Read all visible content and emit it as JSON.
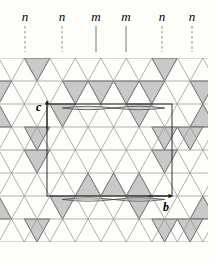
{
  "figure": {
    "width": 214,
    "height": 262,
    "background": "#fdfdfa"
  },
  "symmetry_planes": {
    "label_baseline_y": 21,
    "line_top_y": 26,
    "line_bottom_y": 52,
    "items": [
      {
        "text": "n",
        "x": 25,
        "line": "dashed"
      },
      {
        "text": "n",
        "x": 62,
        "line": "dashed"
      },
      {
        "text": "m",
        "x": 96,
        "line": "solid"
      },
      {
        "text": "m",
        "x": 126,
        "line": "solid"
      },
      {
        "text": "n",
        "x": 162,
        "line": "dashed"
      },
      {
        "text": "n",
        "x": 192,
        "line": "dashed"
      }
    ]
  },
  "axes": {
    "c": {
      "label": "c",
      "label_x": 36,
      "label_y": 111,
      "x": 47,
      "y_from": 130,
      "y_to": 100
    },
    "b": {
      "label": "b",
      "label_x": 163,
      "label_y": 211,
      "y": 196,
      "x_from": 148,
      "x_to": 173
    }
  },
  "unit_cell": {
    "x1": 47,
    "y1": 104,
    "x2": 172,
    "y2": 196
  },
  "lattice": {
    "top_y": 58,
    "row_height": 23,
    "rows": 8,
    "col_spacing": 25.5,
    "even_row_offset": -1.2,
    "odd_row_offset": 11.55,
    "clip_left": 0,
    "clip_right": 208
  },
  "shaded_triangles": [
    {
      "row": 1,
      "cx": 37.05,
      "dir": "down"
    },
    {
      "row": 1,
      "cx": 164.55,
      "dir": "down"
    },
    {
      "row": 2,
      "cx": -1.2,
      "dir": "down"
    },
    {
      "row": 2,
      "cx": 75.3,
      "dir": "down"
    },
    {
      "row": 2,
      "cx": 100.8,
      "dir": "down"
    },
    {
      "row": 2,
      "cx": 126.3,
      "dir": "down"
    },
    {
      "row": 2,
      "cx": 151.8,
      "dir": "down"
    },
    {
      "row": 2,
      "cx": 202.8,
      "dir": "down"
    },
    {
      "row": 3,
      "cx": 62.55,
      "dir": "down"
    },
    {
      "row": 3,
      "cx": 139.05,
      "dir": "down"
    },
    {
      "row": 3,
      "cx": -1.2,
      "dir": "up"
    },
    {
      "row": 3,
      "cx": 202.8,
      "dir": "up"
    },
    {
      "row": 4,
      "cx": 37.05,
      "dir": "down"
    },
    {
      "row": 4,
      "cx": 164.55,
      "dir": "down"
    },
    {
      "row": 4,
      "cx": 190.05,
      "dir": "down"
    },
    {
      "row": 5,
      "cx": 37.05,
      "dir": "down"
    },
    {
      "row": 5,
      "cx": 164.55,
      "dir": "down"
    },
    {
      "row": 6,
      "cx": 88.05,
      "dir": "up"
    },
    {
      "row": 6,
      "cx": 113.55,
      "dir": "up"
    },
    {
      "row": 6,
      "cx": 139.05,
      "dir": "up"
    },
    {
      "row": 7,
      "cx": 62.55,
      "dir": "down"
    },
    {
      "row": 7,
      "cx": 139.05,
      "dir": "down"
    },
    {
      "row": 7,
      "cx": -1.2,
      "dir": "up"
    },
    {
      "row": 7,
      "cx": 202.8,
      "dir": "up"
    },
    {
      "row": 8,
      "cx": 37.05,
      "dir": "down"
    },
    {
      "row": 8,
      "cx": 164.55,
      "dir": "down"
    },
    {
      "row": 8,
      "cx": 190.05,
      "dir": "down"
    }
  ],
  "lenses": {
    "rows": [
      {
        "y": 108,
        "tips": [
          62.55,
          113.55,
          164.55
        ],
        "half_height": 3.4
      },
      {
        "y": 199.5,
        "tips": [
          62.55,
          113.55,
          164.55
        ],
        "half_height": 3.4
      }
    ]
  },
  "colors": {
    "grid": "#8f8f8f",
    "shaded_fill": "#c9c9c9",
    "shaded_edge": "#5e5e5e",
    "cell_line": "#1c1c1c",
    "lens_stroke": "#4a4a4a",
    "plane_dashed": "#8d8d8d",
    "plane_solid": "#787878",
    "text": "#000000"
  }
}
